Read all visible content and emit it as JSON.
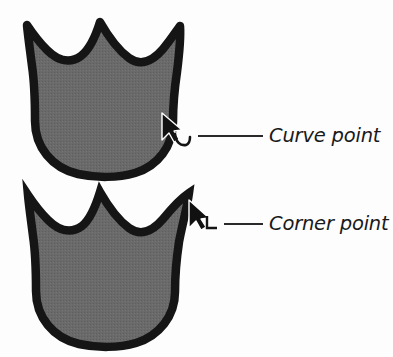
{
  "figure": {
    "background_color": "#fdfdfd",
    "shape_fill_color": "#6a6a6a",
    "shape_stroke_color": "#151515",
    "label_color": "#1a1a1a",
    "leader_line_color": "#2a2a2a"
  },
  "callouts": [
    {
      "id": "curve-point",
      "label": "Curve point",
      "cursor_icon": "arrow-cursor-icon",
      "badge_icon": "curve-arc-icon",
      "shape_icon": "tulip-shape-rounded-icon"
    },
    {
      "id": "corner-point",
      "label": "Corner point",
      "cursor_icon": "arrow-cursor-icon",
      "badge_icon": "corner-angle-icon",
      "shape_icon": "tulip-shape-pointed-icon"
    }
  ]
}
